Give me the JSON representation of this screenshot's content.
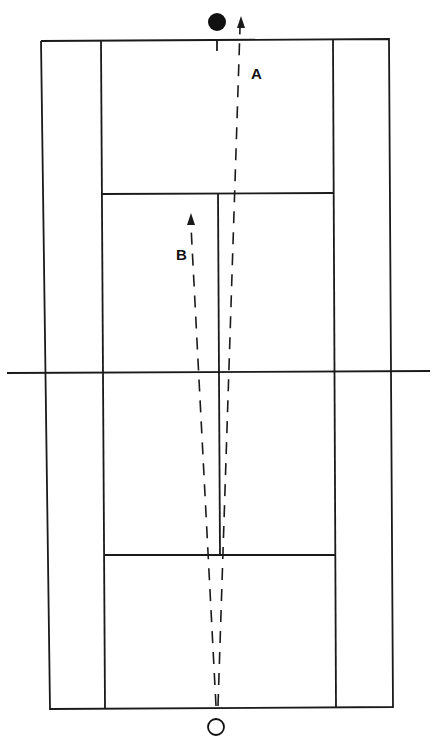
{
  "diagram": {
    "type": "tennis-court-shot-paths",
    "labels": {
      "a": "A",
      "b": "B"
    },
    "colors": {
      "line": "#1a1a1a",
      "background": "#ffffff"
    },
    "players": [
      {
        "name": "opponent",
        "style": "filled",
        "x": 217,
        "y": 22
      },
      {
        "name": "hitter",
        "style": "hollow",
        "x": 216,
        "y": 727
      }
    ],
    "shots": [
      {
        "label": "A",
        "from": [
          218,
          705
        ],
        "to": [
          241,
          18
        ]
      },
      {
        "label": "B",
        "from": [
          216,
          705
        ],
        "to": [
          191,
          215
        ]
      }
    ]
  }
}
